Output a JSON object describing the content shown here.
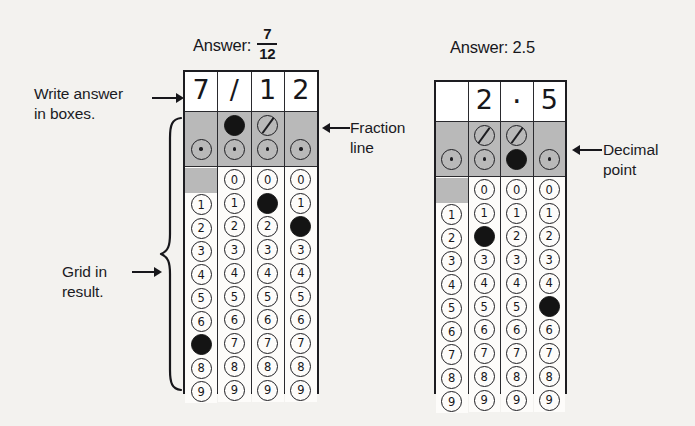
{
  "diagram": {
    "title_note": "Grid-in answer sheet example",
    "labels": {
      "write_answer": "Write answer\nin boxes.",
      "grid_in_result": "Grid in\nresult.",
      "fraction_line": "Fraction\nline",
      "decimal_point": "Decimal\npoint"
    },
    "icons": {
      "arrow_right": "arrow-right-icon",
      "arrow_left": "arrow-left-icon",
      "curly_brace": "curly-brace-icon"
    },
    "colors": {
      "ink": "#17171b",
      "shaded_cell": "#b9b9b9",
      "filled_bubble": "#141414",
      "paper": "#fdfcfa",
      "background": "#f3f2ef"
    }
  },
  "grids": [
    {
      "id": "grid-left",
      "answer_label": "Answer:",
      "answer_type": "fraction",
      "answer_numerator": "7",
      "answer_denominator": "12",
      "answer_text": "7/12",
      "columns": [
        {
          "written": "7",
          "has_slash_bubble": false,
          "slash_filled": false,
          "has_dot_bubble": true,
          "dot_filled": false,
          "has_zero": false,
          "digits": [
            "0",
            "1",
            "2",
            "3",
            "4",
            "5",
            "6",
            "7",
            "8",
            "9"
          ],
          "filled_digit": "7"
        },
        {
          "written": "/",
          "has_slash_bubble": true,
          "slash_filled": true,
          "has_dot_bubble": true,
          "dot_filled": false,
          "has_zero": true,
          "digits": [
            "0",
            "1",
            "2",
            "3",
            "4",
            "5",
            "6",
            "7",
            "8",
            "9"
          ],
          "filled_digit": null
        },
        {
          "written": "1",
          "has_slash_bubble": true,
          "slash_filled": false,
          "has_dot_bubble": true,
          "dot_filled": false,
          "has_zero": true,
          "digits": [
            "0",
            "1",
            "2",
            "3",
            "4",
            "5",
            "6",
            "7",
            "8",
            "9"
          ],
          "filled_digit": "1"
        },
        {
          "written": "2",
          "has_slash_bubble": false,
          "slash_filled": false,
          "has_dot_bubble": true,
          "dot_filled": false,
          "has_zero": true,
          "digits": [
            "0",
            "1",
            "2",
            "3",
            "4",
            "5",
            "6",
            "7",
            "8",
            "9"
          ],
          "filled_digit": "2"
        }
      ]
    },
    {
      "id": "grid-right",
      "answer_label": "Answer: 2.5",
      "answer_type": "decimal",
      "answer_text": "2.5",
      "columns": [
        {
          "written": "",
          "has_slash_bubble": false,
          "slash_filled": false,
          "has_dot_bubble": true,
          "dot_filled": false,
          "has_zero": false,
          "digits": [
            "0",
            "1",
            "2",
            "3",
            "4",
            "5",
            "6",
            "7",
            "8",
            "9"
          ],
          "filled_digit": null
        },
        {
          "written": "2",
          "has_slash_bubble": true,
          "slash_filled": false,
          "has_dot_bubble": true,
          "dot_filled": false,
          "has_zero": true,
          "digits": [
            "0",
            "1",
            "2",
            "3",
            "4",
            "5",
            "6",
            "7",
            "8",
            "9"
          ],
          "filled_digit": "2"
        },
        {
          "written": ".",
          "has_slash_bubble": true,
          "slash_filled": false,
          "has_dot_bubble": true,
          "dot_filled": true,
          "has_zero": true,
          "digits": [
            "0",
            "1",
            "2",
            "3",
            "4",
            "5",
            "6",
            "7",
            "8",
            "9"
          ],
          "filled_digit": null
        },
        {
          "written": "5",
          "has_slash_bubble": false,
          "slash_filled": false,
          "has_dot_bubble": true,
          "dot_filled": false,
          "has_zero": true,
          "digits": [
            "0",
            "1",
            "2",
            "3",
            "4",
            "5",
            "6",
            "7",
            "8",
            "9"
          ],
          "filled_digit": "5"
        }
      ]
    }
  ]
}
